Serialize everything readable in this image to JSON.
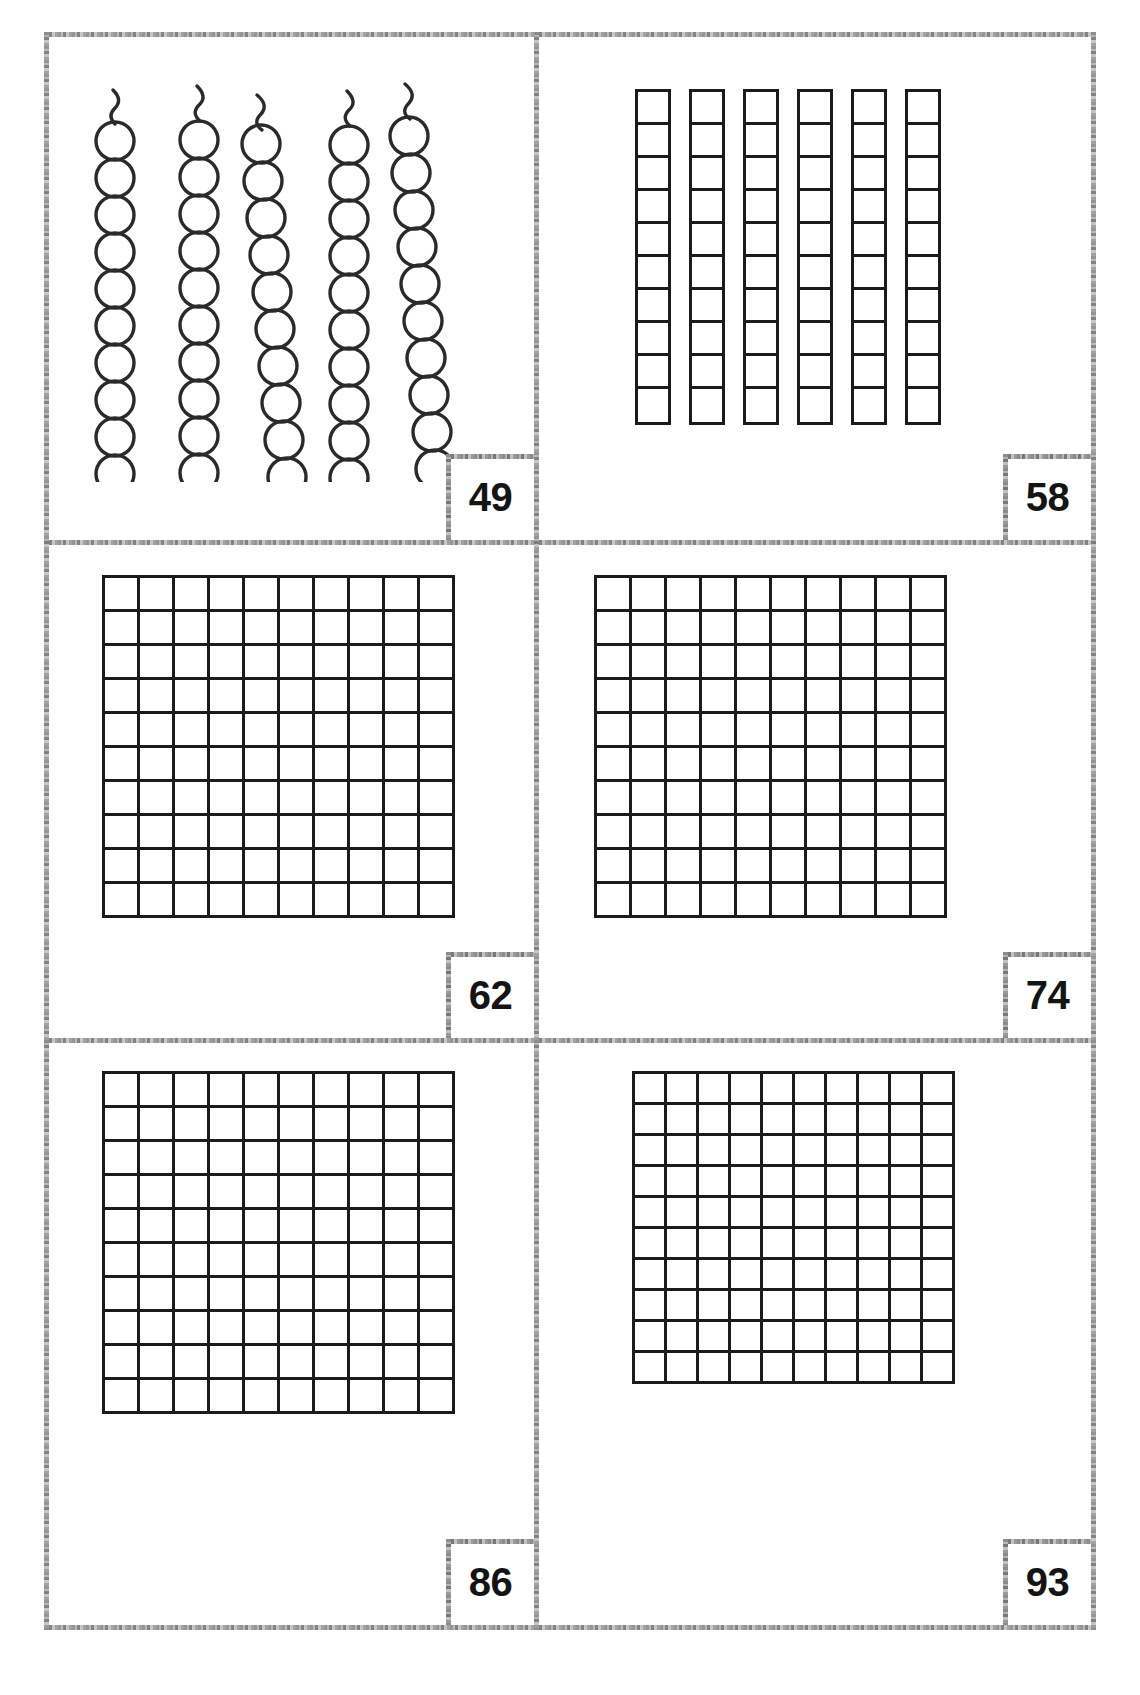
{
  "worksheet": {
    "title": "base-ten blocks place value worksheet",
    "frame_color": "#9a9a9a",
    "ink_color": "#1b1b1b",
    "background": "#ffffff",
    "columns": 2,
    "rows": 3
  },
  "cells": [
    {
      "id": "cell-1",
      "position": "top-left",
      "answer": "49",
      "manipulative": "bead-strings",
      "bead_string_count": 5,
      "beads_per_string": 10,
      "total_beads": 50
    },
    {
      "id": "cell-2",
      "position": "top-right",
      "answer": "58",
      "manipulative": "unit-rods",
      "rod_count": 6,
      "units_per_rod": 10,
      "total_units": 60
    },
    {
      "id": "cell-3",
      "position": "middle-left",
      "answer": "62",
      "manipulative": "hundred-square",
      "grid_columns": 10,
      "grid_rows": 10,
      "total_units": 100
    },
    {
      "id": "cell-4",
      "position": "middle-right",
      "answer": "74",
      "manipulative": "hundred-square",
      "grid_columns": 10,
      "grid_rows": 10,
      "total_units": 100
    },
    {
      "id": "cell-5",
      "position": "bottom-left",
      "answer": "86",
      "manipulative": "hundred-square",
      "grid_columns": 10,
      "grid_rows": 10,
      "total_units": 100
    },
    {
      "id": "cell-6",
      "position": "bottom-right",
      "answer": "93",
      "manipulative": "hundred-square",
      "grid_columns": 10,
      "grid_rows": 10,
      "total_units": 100
    }
  ]
}
